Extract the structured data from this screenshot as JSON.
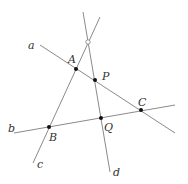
{
  "diagram": {
    "colors": {
      "line": "#8a8a8a",
      "point": "#111111",
      "label": "#333333",
      "background": "#ffffff"
    },
    "lines": [
      {
        "id": "a",
        "label": "a",
        "x1": 40,
        "y1": 45,
        "x2": 175,
        "y2": 133,
        "label_x": 28,
        "label_y": 49
      },
      {
        "id": "b",
        "label": "b",
        "x1": 14,
        "y1": 133,
        "x2": 175,
        "y2": 105,
        "label_x": 8,
        "label_y": 132
      },
      {
        "id": "c",
        "label": "c",
        "x1": 33,
        "y1": 163,
        "x2": 100,
        "y2": 17,
        "label_x": 37,
        "label_y": 168
      },
      {
        "id": "d",
        "label": "d",
        "x1": 83,
        "y1": 12,
        "x2": 110,
        "y2": 172,
        "label_x": 113,
        "label_y": 176
      }
    ],
    "points": [
      {
        "id": "A",
        "label": "A",
        "x": 76,
        "y": 69,
        "filled": true,
        "label_x": 68,
        "label_y": 63
      },
      {
        "id": "P",
        "label": "P",
        "x": 95,
        "y": 80,
        "filled": true,
        "label_x": 102,
        "label_y": 80
      },
      {
        "id": "C",
        "label": "C",
        "x": 141,
        "y": 110,
        "filled": true,
        "label_x": 138,
        "label_y": 106
      },
      {
        "id": "B",
        "label": "B",
        "x": 49,
        "y": 127,
        "filled": true,
        "label_x": 49,
        "label_y": 141
      },
      {
        "id": "Q",
        "label": "Q",
        "x": 101,
        "y": 118,
        "filled": true,
        "label_x": 104,
        "label_y": 131
      },
      {
        "id": "O",
        "label": "",
        "x": 88,
        "y": 42,
        "filled": false,
        "label_x": 0,
        "label_y": 0
      }
    ]
  }
}
